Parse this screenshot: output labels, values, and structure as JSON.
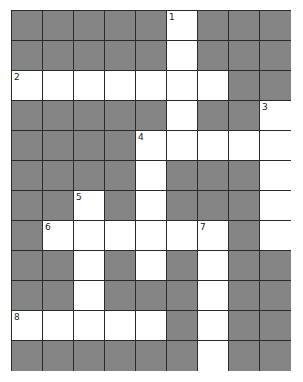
{
  "puzzle": {
    "rows": 12,
    "cols": 9,
    "colors": {
      "block": "#858585",
      "open": "#ffffff",
      "line": "#2b2b2b"
    },
    "layout": [
      "#####.###",
      "#####.###",
      ".......##",
      "#####.##.",
      "####.....",
      "####.###.",
      "##.#.###.",
      "#.......#.",
      "##.#.#.##",
      "##.###.##",
      ".....#.##",
      "######.##"
    ],
    "numbers": [
      {
        "row": 0,
        "col": 5,
        "label": "1"
      },
      {
        "row": 2,
        "col": 0,
        "label": "2"
      },
      {
        "row": 3,
        "col": 8,
        "label": "3"
      },
      {
        "row": 4,
        "col": 4,
        "label": "4"
      },
      {
        "row": 6,
        "col": 2,
        "label": "5"
      },
      {
        "row": 7,
        "col": 1,
        "label": "6"
      },
      {
        "row": 7,
        "col": 6,
        "label": "7"
      },
      {
        "row": 10,
        "col": 0,
        "label": "8"
      }
    ]
  }
}
